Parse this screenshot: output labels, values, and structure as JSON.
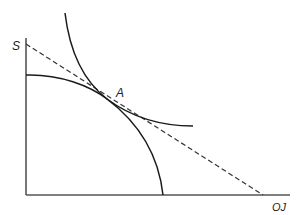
{
  "diagram": {
    "type": "production-possibility-frontier with indifference curve",
    "labels": {
      "y_axis": "S",
      "x_axis": "OJ",
      "tangency_point": "A"
    },
    "elements": [
      {
        "name": "y-axis",
        "style": "solid"
      },
      {
        "name": "x-axis",
        "style": "solid"
      },
      {
        "name": "production-possibility-frontier",
        "shape": "concave arc",
        "style": "solid"
      },
      {
        "name": "indifference-curve",
        "shape": "convex curve",
        "style": "solid"
      },
      {
        "name": "price-line",
        "shape": "straight line from S on y-axis to x-axis",
        "style": "dashed"
      }
    ],
    "colors": {
      "axis": "#555555",
      "curve": "#1a1a1a",
      "dashed": "#333333"
    }
  }
}
